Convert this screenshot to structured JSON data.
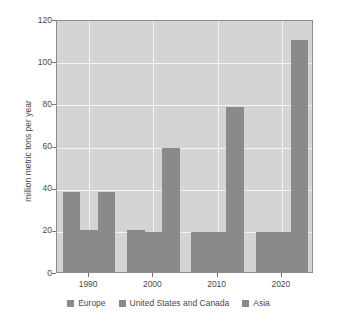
{
  "chart_data": {
    "type": "bar",
    "title": "",
    "subtitle": "",
    "xlabel": "",
    "ylabel": "million metric tons per year",
    "categories": [
      "1990",
      "2000",
      "2010",
      "2020"
    ],
    "series": [
      {
        "name": "Europe",
        "values": [
          38,
          20,
          19,
          19
        ],
        "color": "#8a8a8a"
      },
      {
        "name": "United States and Canada",
        "values": [
          20,
          19,
          19,
          19
        ],
        "color": "#8a8a8a"
      },
      {
        "name": "Asia",
        "values": [
          38,
          59,
          78.5,
          110
        ],
        "color": "#8a8a8a"
      }
    ],
    "ylim": [
      0,
      120
    ],
    "yticks": [
      0,
      20,
      40,
      60,
      80,
      100,
      120
    ],
    "ytick_labels": [
      "0",
      "20",
      "40",
      "60",
      "80",
      "100",
      "120"
    ],
    "xtick_labels": [
      "1990",
      "2000",
      "2010",
      "2020"
    ],
    "grid": true,
    "grid_color": "#f4f4f4",
    "plot_background": "#d4d4d4",
    "figure_background": "#ffffff",
    "legend_position": "bottom",
    "legend_entries": [
      "Europe",
      "United States and Canada",
      "Asia"
    ]
  }
}
